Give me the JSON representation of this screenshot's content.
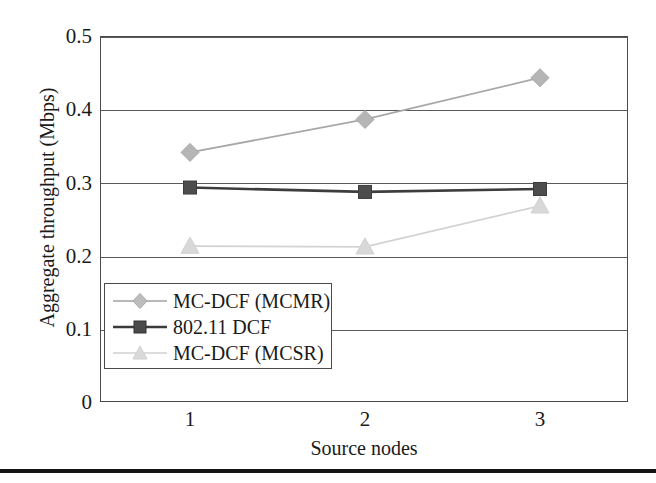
{
  "chart_data": {
    "type": "line",
    "title": "",
    "xlabel": "Source nodes",
    "ylabel": "Aggregate throughput (Mbps)",
    "categories": [
      "1",
      "2",
      "3"
    ],
    "x": [
      1,
      2,
      3
    ],
    "xlim": [
      0.5,
      3.5
    ],
    "ylim": [
      0,
      0.5
    ],
    "yticks": [
      "0",
      "0.1",
      "0.2",
      "0.3",
      "0.4",
      "0.5"
    ],
    "ytick_values": [
      0,
      0.1,
      0.2,
      0.3,
      0.4,
      0.5
    ],
    "xticks": [
      "1",
      "2",
      "3"
    ],
    "grid": "horizontal",
    "legend_position": "lower-left-inside",
    "series": [
      {
        "name": "MC-DCF (MCMR)",
        "marker": "diamond",
        "color": "#b5b5b5",
        "line_color": "#a8a8a8",
        "values": [
          0.341,
          0.386,
          0.443
        ]
      },
      {
        "name": "802.11 DCF",
        "marker": "square",
        "color": "#4d4d4d",
        "line_color": "#3d3d3d",
        "values": [
          0.293,
          0.287,
          0.291
        ]
      },
      {
        "name": "MC-DCF (MCSR)",
        "marker": "triangle",
        "color": "#d8d8d8",
        "line_color": "#d2d2d2",
        "values": [
          0.213,
          0.212,
          0.268
        ]
      }
    ]
  },
  "axis": {
    "y_ticks": [
      {
        "label": "0.5",
        "value": 0.5
      },
      {
        "label": "0.4",
        "value": 0.4
      },
      {
        "label": "0.3",
        "value": 0.3
      },
      {
        "label": "0.2",
        "value": 0.2
      },
      {
        "label": "0.1",
        "value": 0.1
      },
      {
        "label": "0",
        "value": 0
      }
    ],
    "x_ticks": [
      {
        "label": "1",
        "value": 1
      },
      {
        "label": "2",
        "value": 2
      },
      {
        "label": "3",
        "value": 3
      }
    ],
    "y_title": "Aggregate throughput (Mbps)",
    "x_title": "Source nodes"
  },
  "legend": {
    "items": [
      {
        "label": "MC-DCF (MCMR)",
        "marker": "diamond-marker"
      },
      {
        "label": "802.11 DCF",
        "marker": "square-marker"
      },
      {
        "label": "MC-DCF (MCSR)",
        "marker": "triangle-marker"
      }
    ]
  }
}
